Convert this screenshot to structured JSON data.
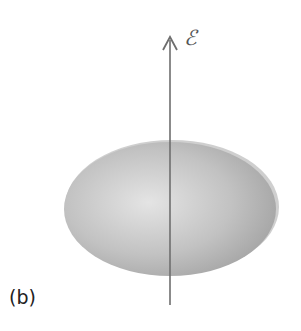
{
  "figure": {
    "panel_label": "(b)",
    "field_label": "ℰ",
    "axis": {
      "x": 170,
      "y_top": 37,
      "y_bottom": 305,
      "color": "#6e6e6e"
    },
    "ellipsoid": {
      "cx": 170,
      "cy": 209,
      "rx": 108,
      "ry": 68,
      "color_light": "#e4e4e4",
      "color_mid": "#bdbdbd",
      "color_dark": "#9a9a9a",
      "rim_color": "#c9c9c9"
    }
  }
}
